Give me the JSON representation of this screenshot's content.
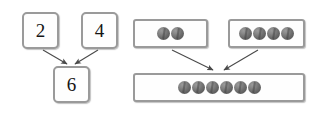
{
  "figure": {
    "background_color": "#ffffff",
    "box_border_color": "#9a9a9a",
    "counter_color": "#6f6f6f",
    "arrow_color": "#4a4a4a"
  },
  "number_bond": {
    "name": "number-bond",
    "part_one": "2",
    "part_two": "4",
    "whole": "6",
    "arrow_count": 2
  },
  "counter_model": {
    "name": "counter-model",
    "group_one_count": 2,
    "group_two_count": 4,
    "total_count": 6,
    "group_one_counters": [
      "counter",
      "counter"
    ],
    "group_two_counters": [
      "counter",
      "counter",
      "counter",
      "counter"
    ],
    "total_counters": [
      "counter",
      "counter",
      "counter",
      "counter",
      "counter",
      "counter"
    ],
    "arrow_count": 2
  }
}
